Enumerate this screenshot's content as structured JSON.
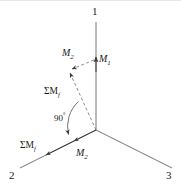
{
  "figure": {
    "background_color": "#ffffff",
    "line_color": "#555555",
    "text_color": "#1a1a1a",
    "width": 181,
    "height": 189
  },
  "axes": [
    {
      "name": "axis-1",
      "label": "1",
      "direction": "up",
      "label_x": 92,
      "label_y": 6
    },
    {
      "name": "axis-2",
      "label": "2",
      "direction": "lower-left",
      "label_x": 9,
      "label_y": 170
    },
    {
      "name": "axis-3",
      "label": "3",
      "direction": "lower-right",
      "label_x": 166,
      "label_y": 170
    }
  ],
  "vectors": [
    {
      "name": "m1",
      "label": "M",
      "sub": "1",
      "label_x": 99,
      "label_y": 54,
      "style": "solid"
    },
    {
      "name": "m2-upper",
      "label": "M",
      "sub": "2",
      "label_x": 62,
      "label_y": 48,
      "style": "dashed"
    },
    {
      "name": "m2-lower",
      "label": "M",
      "sub": "2",
      "label_x": 76,
      "label_y": 148,
      "style": "solid"
    },
    {
      "name": "sum-mf-upper",
      "label": "ΣM",
      "sub": "f",
      "label_x": 44,
      "label_y": 87,
      "style": "dashed"
    },
    {
      "name": "sum-mf-lower",
      "label": "ΣM",
      "sub": "f",
      "label_x": 20,
      "label_y": 141,
      "style": "solid"
    }
  ],
  "annotations": [
    {
      "name": "right-angle",
      "label": "90",
      "unit": "°",
      "label_x": 54,
      "label_y": 112
    }
  ],
  "geometry": {
    "origin_x": 96,
    "origin_y": 130,
    "axis1_tip_y": 22,
    "axis2_tip_x": 20,
    "axis2_tip_y": 168,
    "axis3_tip_x": 172,
    "axis3_tip_y": 168,
    "m1_arrow_y": 57,
    "sum_upper_tip_x": 68,
    "sum_upper_tip_y": 71,
    "m2_upper_tip_x": 74,
    "m2_upper_tip_y": 65,
    "angle_degrees": 90
  }
}
